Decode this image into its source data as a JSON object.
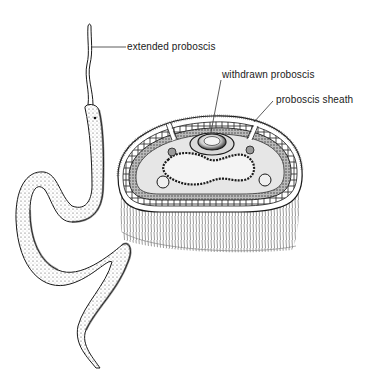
{
  "diagram": {
    "colors": {
      "ink": "#1a1a1a",
      "background": "#ffffff",
      "shade": "#7a7a7a"
    },
    "labels": [
      {
        "id": "extended",
        "text": "extended proboscis",
        "x": 127,
        "y": 41
      },
      {
        "id": "withdrawn",
        "text": "withdrawn proboscis",
        "x": 222,
        "y": 69
      },
      {
        "id": "sheath",
        "text": "proboscis sheath",
        "x": 276,
        "y": 94
      }
    ],
    "parts": [
      "whole-worm-body",
      "extended-proboscis",
      "cross-section-body",
      "withdrawn-proboscis",
      "proboscis-sheath",
      "gut",
      "lateral-nerve-cords",
      "ciliated-epidermis"
    ]
  }
}
